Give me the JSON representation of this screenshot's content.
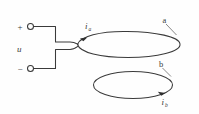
{
  "figure": {
    "background_color": "#fefefe",
    "line_color": "#3a3a3a",
    "label_color": "#3b3b3b",
    "width": 199,
    "height": 114
  },
  "source": {
    "voltage_label": "u",
    "positive_sign": "+",
    "negative_sign": "−",
    "positive_terminal_name": "positive-terminal",
    "negative_terminal_name": "negative-terminal"
  },
  "loops": [
    {
      "id": "a",
      "node_label": "a",
      "current_symbol": "i",
      "current_subscript": "a",
      "description": "upper driven loop connected to the source"
    },
    {
      "id": "b",
      "node_label": "b",
      "current_symbol": "i",
      "current_subscript": "b",
      "description": "lower closed loop carrying induced current"
    }
  ],
  "icons": {
    "terminal": "circle-terminal-icon",
    "current_arrow_a": "current-arrow-icon",
    "current_arrow_b": "current-arrow-icon"
  }
}
